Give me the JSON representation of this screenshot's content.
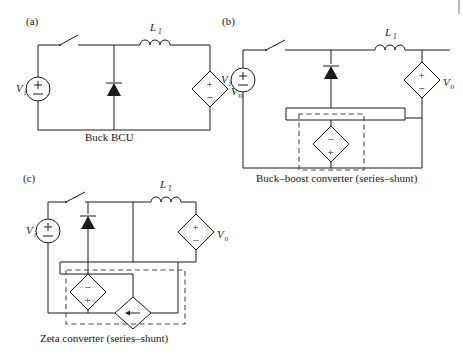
{
  "figure": {
    "background_color": "#ffffff",
    "line_color": "#1a1a1a",
    "dashed_color": "#4a4a4a"
  },
  "panels": [
    {
      "id": "a",
      "label": "(a)",
      "caption": "Buck BCU",
      "source_label": "V",
      "source_sub": "i",
      "source_symbol": "±",
      "inductor_label": "L",
      "inductor_sub": "1",
      "output_label": "V",
      "output_sub": "o",
      "output_plus": "+",
      "output_minus": "−",
      "components": [
        "switch",
        "diode",
        "inductor",
        "input-source",
        "output-source"
      ],
      "dashed_box": false
    },
    {
      "id": "b",
      "label": "(b)",
      "caption": "Buck–boost converter (series–shunt)",
      "source_label": "V",
      "source_sub": "i",
      "source_symbol": "±",
      "inductor_label": "L",
      "inductor_sub": "1",
      "output_label": "V",
      "output_sub": "o",
      "output_plus": "+",
      "output_minus": "−",
      "dependent_top": "−",
      "dependent_bottom": "+",
      "components": [
        "switch",
        "diode",
        "inductor",
        "input-source",
        "output-source",
        "dependent-voltage-source"
      ],
      "dashed_box": true
    },
    {
      "id": "c",
      "label": "(c)",
      "caption": "Zeta converter (series–shunt)",
      "source_label": "V",
      "source_sub": "i",
      "source_symbol": "±",
      "inductor_label": "L",
      "inductor_sub": "1",
      "output_label": "V",
      "output_sub": "o",
      "output_plus": "+",
      "output_minus": "−",
      "dependent_top": "−",
      "dependent_bottom": "+",
      "current_source_glyph": "←",
      "components": [
        "switch",
        "diode",
        "inductor",
        "input-source",
        "output-source",
        "dependent-voltage-source",
        "dependent-current-source"
      ],
      "dashed_box": true
    }
  ]
}
